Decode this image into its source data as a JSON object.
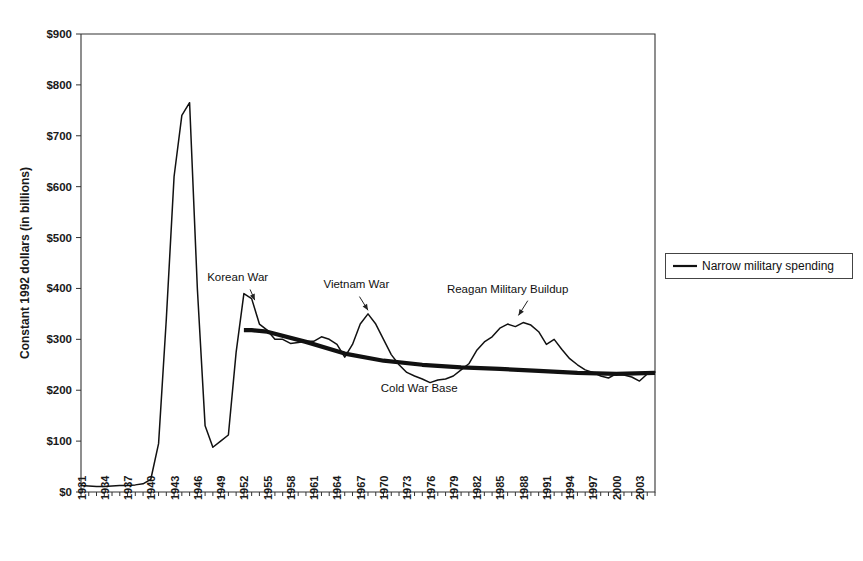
{
  "chart_data": {
    "type": "line",
    "title": "",
    "xlabel": "",
    "ylabel": "Constant 1992 dollars (in billions)",
    "xlim": [
      1931,
      2005
    ],
    "ylim": [
      0,
      900
    ],
    "grid": false,
    "legend_position": "right-outside",
    "y_ticks": [
      "$0",
      "$100",
      "$200",
      "$300",
      "$400",
      "$500",
      "$600",
      "$700",
      "$800",
      "$900"
    ],
    "y_tick_values": [
      0,
      100,
      200,
      300,
      400,
      500,
      600,
      700,
      800,
      900
    ],
    "x_ticks": [
      "1931",
      "1934",
      "1937",
      "1940",
      "1943",
      "1946",
      "1949",
      "1952",
      "1955",
      "1958",
      "1961",
      "1964",
      "1967",
      "1970",
      "1973",
      "1976",
      "1979",
      "1982",
      "1985",
      "1988",
      "1991",
      "1994",
      "1997",
      "2000",
      "2003"
    ],
    "x_tick_values": [
      1931,
      1934,
      1937,
      1940,
      1943,
      1946,
      1949,
      1952,
      1955,
      1958,
      1961,
      1964,
      1967,
      1970,
      1973,
      1976,
      1979,
      1982,
      1985,
      1988,
      1991,
      1994,
      1997,
      2000,
      2003
    ],
    "series": [
      {
        "name": "Narrow military spending",
        "color": "#111111",
        "style": "thin",
        "x": [
          1931,
          1932,
          1933,
          1934,
          1935,
          1936,
          1937,
          1938,
          1939,
          1940,
          1941,
          1942,
          1943,
          1944,
          1945,
          1946,
          1947,
          1948,
          1949,
          1950,
          1951,
          1952,
          1953,
          1954,
          1955,
          1956,
          1957,
          1958,
          1959,
          1960,
          1961,
          1962,
          1963,
          1964,
          1965,
          1966,
          1967,
          1968,
          1969,
          1970,
          1971,
          1972,
          1973,
          1974,
          1975,
          1976,
          1977,
          1978,
          1979,
          1980,
          1981,
          1982,
          1983,
          1984,
          1985,
          1986,
          1987,
          1988,
          1989,
          1990,
          1991,
          1992,
          1993,
          1994,
          1995,
          1996,
          1997,
          1998,
          1999,
          2000,
          2001,
          2002,
          2003,
          2004,
          2005
        ],
        "y": [
          13,
          12,
          11,
          11,
          12,
          13,
          13,
          14,
          16,
          25,
          95,
          340,
          620,
          740,
          765,
          400,
          130,
          88,
          100,
          112,
          275,
          390,
          380,
          330,
          318,
          300,
          300,
          292,
          294,
          296,
          296,
          305,
          300,
          290,
          265,
          290,
          330,
          350,
          330,
          300,
          270,
          250,
          235,
          228,
          222,
          215,
          220,
          222,
          228,
          240,
          252,
          278,
          295,
          305,
          322,
          330,
          325,
          333,
          328,
          315,
          290,
          300,
          280,
          262,
          250,
          240,
          235,
          228,
          224,
          232,
          230,
          226,
          218,
          232,
          236
        ]
      },
      {
        "name": "Cold War Base",
        "color": "#111111",
        "style": "thick",
        "x": [
          1952,
          1953,
          1955,
          1960,
          1965,
          1970,
          1975,
          1980,
          1985,
          1990,
          1995,
          2000,
          2005
        ],
        "y": [
          318,
          318,
          315,
          295,
          272,
          258,
          250,
          245,
          242,
          238,
          234,
          232,
          234
        ]
      }
    ],
    "annotations": [
      {
        "text": "Korean War",
        "label_x": 1951.2,
        "label_y": 415,
        "arrow_from_x": 1952.8,
        "arrow_from_y": 398,
        "arrow_to_x": 1953.4,
        "arrow_to_y": 377
      },
      {
        "text": "Vietnam War",
        "label_x": 1966.5,
        "label_y": 400,
        "arrow_from_x": 1966.9,
        "arrow_from_y": 384,
        "arrow_to_x": 1968.0,
        "arrow_to_y": 357
      },
      {
        "text": "Reagan Military Buildup",
        "label_x": 1986.0,
        "label_y": 392,
        "arrow_from_x": 1988.6,
        "arrow_from_y": 376,
        "arrow_to_x": 1987.4,
        "arrow_to_y": 347
      },
      {
        "text": "Cold War Base",
        "label_x": 1974.6,
        "label_y": 196,
        "arrow_from_x": null,
        "arrow_from_y": null,
        "arrow_to_x": null,
        "arrow_to_y": null
      }
    ],
    "legend": [
      {
        "label": "Narrow military spending",
        "color": "#111111"
      }
    ]
  }
}
